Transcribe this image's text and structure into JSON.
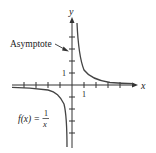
{
  "figure": {
    "function_label": "f(x) = 1/x",
    "function_lhs": "f(x) =",
    "function_numerator": "1",
    "function_denominator": "x",
    "annotation": "Asymptote",
    "x_axis_label": "x",
    "y_axis_label": "y",
    "x_tick_label": "1",
    "y_tick_label": "1",
    "colors": {
      "axis": "#333333",
      "curve": "#444444",
      "text": "#222222"
    }
  }
}
